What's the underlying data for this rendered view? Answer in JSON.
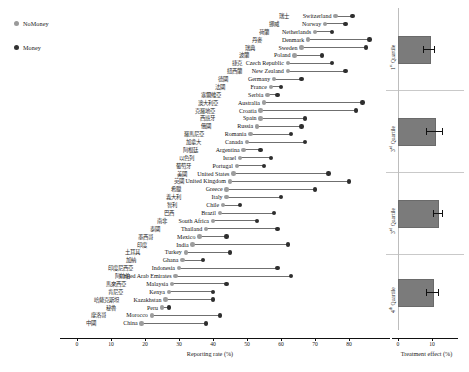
{
  "legend": {
    "items": [
      {
        "label": "NoMoney",
        "color": "#9d9d9d"
      },
      {
        "label": "Money",
        "color": "#2e2e2e"
      }
    ]
  },
  "left_axis": {
    "title": "Reporting rate (%)",
    "ticks": [
      "0",
      "10",
      "20",
      "30",
      "40",
      "50",
      "60",
      "70",
      "80"
    ]
  },
  "right_axis": {
    "title": "Treatment effect (%)",
    "ticks": [
      "0",
      "10"
    ]
  },
  "quartiles": [
    {
      "label": "1",
      "suffix": "st",
      "word": "Quartile"
    },
    {
      "label": "3",
      "suffix": "rd",
      "word": "Quartile"
    },
    {
      "label": "3",
      "suffix": "rd",
      "word": "Quartile"
    },
    {
      "label": "4",
      "suffix": "th",
      "word": "Quartile"
    }
  ],
  "chart_data": {
    "type": "scatter",
    "title": "",
    "xlabel": "Reporting rate (%)",
    "ylabel": "",
    "xlim": [
      0,
      85
    ],
    "grid": false,
    "legend": [
      "NoMoney",
      "Money"
    ],
    "series": [
      {
        "name": "NoMoney",
        "color": "#9d9d9d"
      },
      {
        "name": "Money",
        "color": "#2e2e2e"
      }
    ],
    "categories": [
      "Switzerland",
      "Norway",
      "Netherlands",
      "Denmark",
      "Sweden",
      "Poland",
      "Czech Republic",
      "New Zealand",
      "Germany",
      "France",
      "Serbia",
      "Australia",
      "Croatia",
      "Spain",
      "Russia",
      "Romania",
      "Canada",
      "Argentina",
      "Israel",
      "Portugal",
      "United States",
      "United Kingdom",
      "Greece",
      "Italy",
      "Chile",
      "Brazil",
      "South Africa",
      "Thailand",
      "Mexico",
      "India",
      "Turkey",
      "Ghana",
      "Indonesia",
      "United Arab Emirates",
      "Malaysia",
      "Kenya",
      "Kazakhstan",
      "Peru",
      "Morocco",
      "China"
    ],
    "categories_cn": [
      "瑞士",
      "挪威",
      "荷蘭",
      "丹麥",
      "瑞典",
      "波蘭",
      "捷克",
      "紐西蘭",
      "德國",
      "法國",
      "塞爾維亞",
      "澳大利亞",
      "克羅地亞",
      "西班牙",
      "俄國",
      "羅馬尼亞",
      "加拿大",
      "阿根廷",
      "以色列",
      "葡萄牙",
      "美國",
      "英國",
      "希臘",
      "義大利",
      "智利",
      "巴西",
      "南非",
      "泰國",
      "墨西哥",
      "印度",
      "土耳其",
      "加納",
      "印度尼西亞",
      "阿拉伯",
      "馬來西亞",
      "肯尼亞",
      "哈薩克斯坦",
      "秘魯",
      "摩洛哥",
      "中國"
    ],
    "nomoney": [
      76,
      73,
      70,
      68,
      66,
      64,
      62,
      62,
      58,
      57,
      56,
      55,
      54,
      54,
      53,
      51,
      50,
      49,
      48,
      47,
      46,
      45,
      44,
      44,
      43,
      42,
      40,
      38,
      36,
      34,
      32,
      31,
      30,
      29,
      28,
      27,
      26,
      25,
      22,
      19
    ],
    "money": [
      81,
      79,
      75,
      86,
      85,
      72,
      75,
      79,
      66,
      60,
      59,
      84,
      82,
      67,
      66,
      63,
      67,
      54,
      57,
      55,
      74,
      80,
      70,
      60,
      48,
      58,
      53,
      59,
      44,
      62,
      45,
      37,
      59,
      63,
      44,
      40,
      40,
      27,
      42,
      38
    ]
  },
  "right_chart_data": {
    "type": "bar",
    "title": "",
    "xlabel": "Treatment effect (%)",
    "ylabel": "",
    "xlim": [
      0,
      16
    ],
    "grid": false,
    "orientation": "horizontal",
    "categories": [
      "1st Quartile",
      "3rd Quartile",
      "3rd Quartile",
      "4th Quartile"
    ],
    "values": [
      9.0,
      10.5,
      11.5,
      10.0
    ],
    "errors": [
      1.6,
      2.4,
      1.3,
      1.8
    ]
  },
  "caption": {
    "text": ""
  }
}
